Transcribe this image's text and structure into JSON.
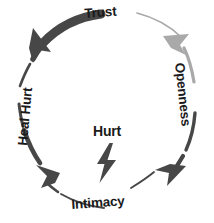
{
  "diagram": {
    "type": "cycle",
    "center": {
      "label": "Hurt",
      "icon": "lightning-bolt-icon",
      "icon_color": "#474747"
    },
    "colors": {
      "arrow_dark": "#474747",
      "arrow_light": "#a9a9a9",
      "text": "#1a1a1a",
      "background": "#ffffff"
    },
    "nodes": [
      {
        "id": "trust",
        "label": "Trust",
        "position": "top"
      },
      {
        "id": "openness",
        "label": "Openness",
        "position": "right"
      },
      {
        "id": "intimacy",
        "label": "Intimacy",
        "position": "bottom"
      },
      {
        "id": "heal-hurt",
        "label": "Heal Hurt",
        "position": "left"
      }
    ],
    "arrows": [
      {
        "id": "trust-to-openness",
        "from": "trust",
        "to": "openness",
        "color": "#a9a9a9",
        "direction": "clockwise",
        "weight": "thin"
      },
      {
        "id": "openness-to-intimacy",
        "from": "openness",
        "to": "intimacy",
        "color": "#474747",
        "direction": "clockwise",
        "weight": "medium"
      },
      {
        "id": "intimacy-to-heal-hurt",
        "from": "intimacy",
        "to": "heal-hurt",
        "color": "#474747",
        "direction": "counterclockwise",
        "weight": "medium"
      },
      {
        "id": "heal-hurt-to-trust",
        "from": "heal-hurt",
        "to": "trust",
        "color": "#474747",
        "direction": "counterclockwise",
        "weight": "thick"
      }
    ]
  }
}
